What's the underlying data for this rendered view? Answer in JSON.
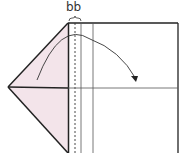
{
  "diagram": {
    "type": "origami-fold-step",
    "label_top": "bb",
    "colors": {
      "paper_back": "#f3e4ea",
      "line": "#222222",
      "thin_line": "#555555",
      "background": "#ffffff"
    },
    "elements": [
      "pink folded triangle flaps on left",
      "square sheet on right",
      "dashed fold line",
      "valley fold lines",
      "curved arrow indicating fold to the right"
    ]
  }
}
